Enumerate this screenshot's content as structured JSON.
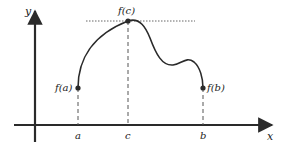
{
  "diagram": {
    "colors": {
      "ink": "#2a2a2a",
      "dash": "#555555",
      "dotted": "#666666"
    },
    "axes": {
      "x_label": "x",
      "y_label": "y"
    },
    "ticks": [
      {
        "label": "a"
      },
      {
        "label": "c"
      },
      {
        "label": "b"
      }
    ],
    "points": [
      {
        "label": "f(a)"
      },
      {
        "label": "f(c)"
      },
      {
        "label": "f(b)"
      }
    ]
  }
}
